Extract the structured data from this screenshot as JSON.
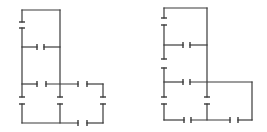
{
  "diagrams": [
    {
      "name": "circuit-left",
      "wires": [
        [
          22,
          10,
          60,
          10
        ],
        [
          22,
          10,
          22,
          22
        ],
        [
          22,
          28,
          22,
          97
        ],
        [
          22,
          104,
          22,
          123
        ],
        [
          60,
          10,
          60,
          97
        ],
        [
          60,
          104,
          60,
          123
        ],
        [
          22,
          47,
          37,
          47
        ],
        [
          44,
          47,
          60,
          47
        ],
        [
          22,
          84,
          37,
          84
        ],
        [
          46,
          84,
          78,
          84
        ],
        [
          87,
          84,
          103,
          84
        ],
        [
          103,
          84,
          103,
          97
        ],
        [
          103,
          104,
          103,
          123
        ],
        [
          22,
          123,
          78,
          123
        ],
        [
          87,
          123,
          103,
          123
        ]
      ],
      "capacitors": [
        {
          "x": 22,
          "y1": 22,
          "y2": 28,
          "orient": "v"
        },
        {
          "x": 22,
          "y1": 97,
          "y2": 104,
          "orient": "v"
        },
        {
          "x": 60,
          "y1": 97,
          "y2": 104,
          "orient": "v"
        },
        {
          "x": 103,
          "y1": 97,
          "y2": 104,
          "orient": "v"
        },
        {
          "y": 47,
          "x1": 37,
          "x2": 44,
          "orient": "h"
        },
        {
          "y": 84,
          "x1": 37,
          "x2": 46,
          "orient": "h"
        },
        {
          "y": 84,
          "x1": 78,
          "x2": 87,
          "orient": "h"
        },
        {
          "y": 123,
          "x1": 78,
          "x2": 87,
          "orient": "h"
        }
      ]
    },
    {
      "name": "circuit-right",
      "wires": [
        [
          164,
          8,
          207,
          8
        ],
        [
          164,
          8,
          164,
          18
        ],
        [
          164,
          25,
          164,
          59
        ],
        [
          164,
          68,
          164,
          97
        ],
        [
          164,
          104,
          164,
          120
        ],
        [
          207,
          8,
          207,
          97
        ],
        [
          207,
          104,
          207,
          120
        ],
        [
          164,
          45,
          183,
          45
        ],
        [
          190,
          45,
          207,
          45
        ],
        [
          164,
          82,
          183,
          82
        ],
        [
          190,
          82,
          252,
          82
        ],
        [
          252,
          82,
          252,
          120
        ],
        [
          164,
          120,
          184,
          120
        ],
        [
          191,
          120,
          230,
          120
        ],
        [
          238,
          120,
          252,
          120
        ]
      ],
      "capacitors": [
        {
          "x": 164,
          "y1": 18,
          "y2": 25,
          "orient": "v"
        },
        {
          "x": 164,
          "y1": 59,
          "y2": 68,
          "orient": "v"
        },
        {
          "x": 164,
          "y1": 97,
          "y2": 104,
          "orient": "v"
        },
        {
          "x": 207,
          "y1": 97,
          "y2": 104,
          "orient": "v"
        },
        {
          "y": 45,
          "x1": 183,
          "x2": 190,
          "orient": "h"
        },
        {
          "y": 82,
          "x1": 183,
          "x2": 190,
          "orient": "h"
        },
        {
          "y": 120,
          "x1": 184,
          "x2": 191,
          "orient": "h"
        },
        {
          "y": 120,
          "x1": 230,
          "x2": 238,
          "orient": "h"
        }
      ]
    }
  ],
  "colors": {
    "line": "#3a3a3a",
    "background": "#ffffff"
  }
}
